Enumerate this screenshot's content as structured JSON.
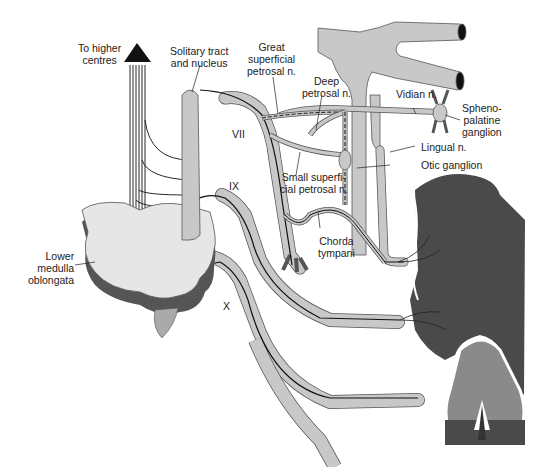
{
  "figure": {
    "colors": {
      "nerve_fill": "#c8c8c8",
      "nerve_stroke": "#555555",
      "medulla_top": "#e6e6e6",
      "medulla_side": "#555555",
      "tongue": "#4a4a4a",
      "epiglottis": "#8a8a8a",
      "fiber": "#111111"
    },
    "labels": {
      "higher_centres": [
        "To higher",
        "centres"
      ],
      "solitary": [
        "Solitary tract",
        "and nucleus"
      ],
      "great_superficial": [
        "Great",
        "superficial",
        "petrosal n."
      ],
      "deep_petrosal": [
        "Deep",
        "petrosal n."
      ],
      "vidian": "Vidian n.",
      "sphenopalatine": [
        "Spheno-",
        "palatine",
        "ganglion"
      ],
      "lingual": "Lingual n.",
      "otic": "Otic ganglion",
      "small_superficial": [
        "Small superfi-",
        "cial petrosal n."
      ],
      "chorda_tympani": [
        "Chorda",
        "tympani"
      ],
      "lower_medulla": [
        "Lower",
        "medulla",
        "oblongata"
      ],
      "cn_vii": "VII",
      "cn_ix": "IX",
      "cn_x": "X"
    }
  }
}
